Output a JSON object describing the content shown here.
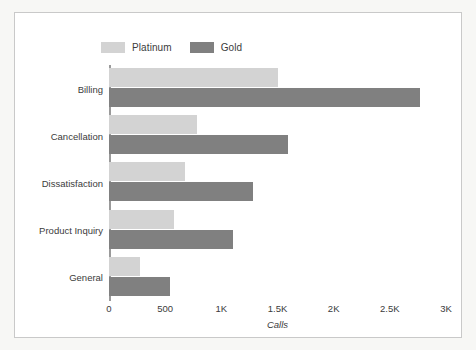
{
  "chart_data": {
    "type": "bar",
    "orientation": "horizontal",
    "title": "",
    "xlabel": "Calls",
    "ylabel": "",
    "xlim": [
      0,
      3000
    ],
    "xticks": [
      0,
      500,
      1000,
      1500,
      2000,
      2500,
      3000
    ],
    "xtick_labels": [
      "0",
      "500",
      "1K",
      "1.5K",
      "2K",
      "2.5K",
      "3K"
    ],
    "grid": false,
    "legend_position": "top-left",
    "categories": [
      "Billing",
      "Cancellation",
      "Dissatisfaction",
      "Product Inquiry",
      "General"
    ],
    "series": [
      {
        "name": "Platinum",
        "color": "#d3d3d3",
        "values": [
          1500,
          780,
          680,
          580,
          280
        ]
      },
      {
        "name": "Gold",
        "color": "#808080",
        "values": [
          2770,
          1590,
          1280,
          1100,
          540
        ]
      }
    ]
  },
  "legend": {
    "items": [
      {
        "label": "Platinum",
        "color": "#d3d3d3"
      },
      {
        "label": "Gold",
        "color": "#808080"
      }
    ]
  },
  "axis": {
    "x_title": "Calls"
  },
  "colors": {
    "platinum": "#d3d3d3",
    "gold": "#808080",
    "axis_line": "#9a9a9a",
    "text": "#3b3b3b",
    "card_background": "#ffffff",
    "card_border": "#c9c9c9",
    "page_background": "#f7f7f5"
  }
}
